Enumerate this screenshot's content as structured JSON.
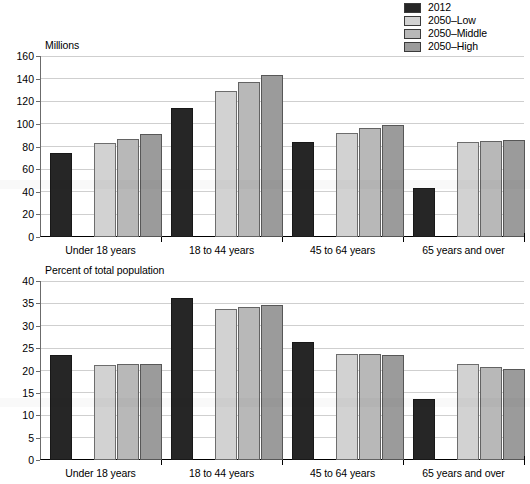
{
  "legend": {
    "items": [
      {
        "label": "2012",
        "color": "#262626"
      },
      {
        "label": "2050–Low",
        "color": "#d2d2d2"
      },
      {
        "label": "2050–Middle",
        "color": "#b8b8b8"
      },
      {
        "label": "2050–High",
        "color": "#9b9b9b"
      }
    ]
  },
  "categories": [
    "Under 18 years",
    "18 to 44 years",
    "45 to 64 years",
    "65 years and over"
  ],
  "chart_data": [
    {
      "type": "bar",
      "title": "Millions",
      "xlabel": "",
      "ylabel": "Millions",
      "ylim": [
        0,
        160
      ],
      "ystep": 20,
      "grid": true,
      "legend_position": "top-right",
      "categories": [
        "Under 18 years",
        "18 to 44 years",
        "45 to 64 years",
        "65 years and over"
      ],
      "yticks": [
        "0",
        "20",
        "40",
        "60",
        "80",
        "100",
        "120",
        "140",
        "160"
      ],
      "series": [
        {
          "name": "2012",
          "color": "#262626",
          "values": [
            74,
            114,
            84,
            43
          ]
        },
        {
          "name": "2050–Low",
          "color": "#d2d2d2",
          "values": [
            83,
            129,
            92,
            84
          ]
        },
        {
          "name": "2050–Middle",
          "color": "#b8b8b8",
          "values": [
            87,
            137,
            96,
            85
          ]
        },
        {
          "name": "2050–High",
          "color": "#9b9b9b",
          "values": [
            91,
            143,
            99,
            86
          ]
        }
      ]
    },
    {
      "type": "bar",
      "title": "Percent of total population",
      "xlabel": "",
      "ylabel": "Percent of total population",
      "ylim": [
        0,
        40
      ],
      "ystep": 5,
      "grid": true,
      "legend_position": "top-right",
      "categories": [
        "Under 18 years",
        "18 to 44 years",
        "45 to 64 years",
        "65 years and over"
      ],
      "yticks": [
        "0",
        "5",
        "10",
        "15",
        "20",
        "25",
        "30",
        "35",
        "40"
      ],
      "series": [
        {
          "name": "2012",
          "color": "#262626",
          "values": [
            23.5,
            36.3,
            26.4,
            13.7
          ]
        },
        {
          "name": "2050–Low",
          "color": "#d2d2d2",
          "values": [
            21.2,
            33.8,
            23.6,
            21.4
          ]
        },
        {
          "name": "2050–Middle",
          "color": "#b8b8b8",
          "values": [
            21.4,
            34.2,
            23.6,
            20.8
          ]
        },
        {
          "name": "2050–High",
          "color": "#9b9b9b",
          "values": [
            21.5,
            34.6,
            23.5,
            20.4
          ]
        }
      ]
    }
  ]
}
